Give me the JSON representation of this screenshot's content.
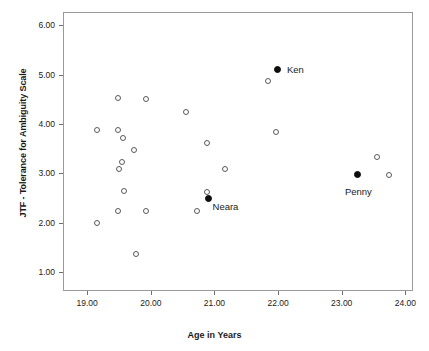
{
  "chart_data": {
    "type": "scatter",
    "title": "",
    "xlabel": "Age in Years",
    "ylabel": "JTF - Tolerance for Ambiguity Scale",
    "xlim": [
      18.62,
      24.12
    ],
    "ylim": [
      0.62,
      6.27
    ],
    "grid": false,
    "legend": "none",
    "xticks": [
      "19.00",
      "20.00",
      "21.00",
      "22.00",
      "23.00",
      "24.00"
    ],
    "xtick_values": [
      19.0,
      20.0,
      21.0,
      22.0,
      23.0,
      24.0
    ],
    "yticks": [
      "1.00",
      "2.00",
      "3.00",
      "4.00",
      "5.00",
      "6.00"
    ],
    "ytick_values": [
      1.0,
      2.0,
      3.0,
      4.0,
      5.0,
      6.0
    ],
    "series": [
      {
        "name": "Unlabeled participants",
        "marker": "open-circle",
        "points": [
          {
            "x": 19.15,
            "y": 2.0
          },
          {
            "x": 19.15,
            "y": 3.89
          },
          {
            "x": 19.48,
            "y": 4.52
          },
          {
            "x": 19.48,
            "y": 3.88
          },
          {
            "x": 19.48,
            "y": 2.25
          },
          {
            "x": 19.57,
            "y": 3.72
          },
          {
            "x": 19.54,
            "y": 3.24
          },
          {
            "x": 19.5,
            "y": 3.1
          },
          {
            "x": 19.58,
            "y": 2.64
          },
          {
            "x": 19.74,
            "y": 3.48
          },
          {
            "x": 19.76,
            "y": 1.36
          },
          {
            "x": 19.92,
            "y": 4.51
          },
          {
            "x": 19.92,
            "y": 2.25
          },
          {
            "x": 20.56,
            "y": 4.24
          },
          {
            "x": 20.89,
            "y": 3.62
          },
          {
            "x": 20.89,
            "y": 2.63
          },
          {
            "x": 20.73,
            "y": 2.25
          },
          {
            "x": 21.17,
            "y": 3.09
          },
          {
            "x": 21.84,
            "y": 4.87
          },
          {
            "x": 21.96,
            "y": 3.85
          },
          {
            "x": 23.56,
            "y": 3.34
          },
          {
            "x": 23.74,
            "y": 2.97
          }
        ]
      },
      {
        "name": "Highlighted participants",
        "marker": "filled-circle",
        "points": [
          {
            "x": 21.99,
            "y": 5.11,
            "label": "Ken"
          },
          {
            "x": 20.9,
            "y": 2.49,
            "label": "Neara"
          },
          {
            "x": 23.25,
            "y": 2.97,
            "label": "Penny"
          }
        ]
      }
    ],
    "annotations": [
      {
        "text": "Ken",
        "x": 22.14,
        "y": 5.09
      },
      {
        "text": "Neara",
        "x": 20.97,
        "y": 2.32
      },
      {
        "text": "Penny",
        "x": 23.05,
        "y": 2.62
      }
    ],
    "colors": {
      "open_marker_stroke": "#5a5a5a",
      "filled_marker": "#0d0d0d",
      "axis_line": "#9a9a9a",
      "text": "#1a1a1a",
      "background": "#ffffff"
    }
  }
}
